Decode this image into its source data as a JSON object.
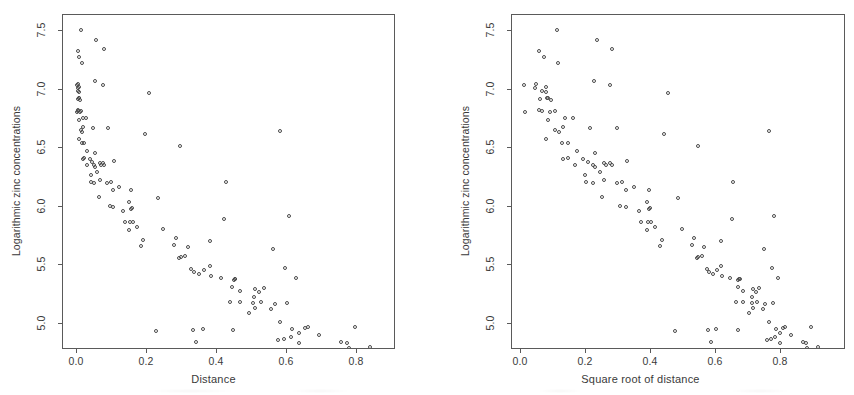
{
  "figure": {
    "panel_count": 2,
    "background": "#ffffff",
    "point_color": "#4a4a4a",
    "axis_color": "#5a5a5a"
  },
  "chart_data": [
    {
      "type": "scatter",
      "title": "",
      "xlabel": "Distance",
      "ylabel": "Logarithmic zinc concentrations",
      "xlim": [
        -0.035,
        0.915
      ],
      "ylim": [
        4.66,
        7.58
      ],
      "xticks": [
        0.0,
        0.2,
        0.4,
        0.6,
        0.8
      ],
      "xticklabels": [
        "0.0",
        "0.2",
        "0.4",
        "0.6",
        "0.8"
      ],
      "yticks": [
        5.0,
        5.5,
        6.0,
        6.5,
        7.0,
        7.5
      ],
      "yticklabels": [
        "5.0",
        "5.5",
        "6.0",
        "6.5",
        "7.0",
        "7.5"
      ],
      "grid": false,
      "legend": "none",
      "marker": "open-circle",
      "x": [
        0.001,
        0.012,
        0.103,
        0.19,
        0.277,
        0.364,
        0.19,
        0.091,
        0.047,
        0.001,
        0.002,
        0.005,
        0.01,
        0.017,
        0.074,
        0.075,
        0.077,
        0.079,
        0.082,
        0.08,
        0.079,
        0.085,
        0.097,
        0.104,
        0.108,
        0.112,
        0.119,
        0.129,
        0.135,
        0.141,
        0.147,
        0.152,
        0.156,
        0.163,
        0.169,
        0.175,
        0.181,
        0.187,
        0.194,
        0.2,
        0.206,
        0.212,
        0.218,
        0.224,
        0.231,
        0.237,
        0.243,
        0.249,
        0.256,
        0.262,
        0.268,
        0.274,
        0.28,
        0.287,
        0.293,
        0.299,
        0.305,
        0.312,
        0.318,
        0.324,
        0.33,
        0.336,
        0.343,
        0.349,
        0.355,
        0.361,
        0.368,
        0.374,
        0.38,
        0.386,
        0.392,
        0.399,
        0.405,
        0.411,
        0.417,
        0.424,
        0.43,
        0.436,
        0.442,
        0.448,
        0.455,
        0.461,
        0.467,
        0.473,
        0.48,
        0.486,
        0.492,
        0.498,
        0.504,
        0.511,
        0.517,
        0.523,
        0.529,
        0.536,
        0.542,
        0.548,
        0.554,
        0.56,
        0.567,
        0.573,
        0.579,
        0.585,
        0.592,
        0.598,
        0.604,
        0.61,
        0.616,
        0.623,
        0.629,
        0.635,
        0.641,
        0.648,
        0.654,
        0.66,
        0.666,
        0.672,
        0.679,
        0.685,
        0.691,
        0.697,
        0.704,
        0.71,
        0.716,
        0.722,
        0.728,
        0.735,
        0.741,
        0.747,
        0.753,
        0.76,
        0.766,
        0.772,
        0.778,
        0.784,
        0.791,
        0.797,
        0.803,
        0.809,
        0.816,
        0.822,
        0.828,
        0.834,
        0.84,
        0.847,
        0.853,
        0.859,
        0.865,
        0.872,
        0.878,
        0.884,
        0.89
      ],
      "y": [
        7.51,
        7.23,
        7.04,
        6.97,
        6.53,
        6.21,
        6.62,
        6.67,
        7.42
      ],
      "n_points": 155,
      "note": "Meuse river soil dataset: log zinc vs normalized distance to river"
    },
    {
      "type": "scatter",
      "title": "",
      "xlabel": "Square root of distance",
      "ylabel": "Logarithmic zinc concentrations",
      "xlim": [
        -0.03,
        0.96
      ],
      "ylim": [
        4.66,
        7.58
      ],
      "xticks": [
        0.0,
        0.2,
        0.4,
        0.6,
        0.8
      ],
      "xticklabels": [
        "0.0",
        "0.2",
        "0.4",
        "0.6",
        "0.8"
      ],
      "yticks": [
        5.0,
        5.5,
        6.0,
        6.5,
        7.0,
        7.5
      ],
      "yticklabels": [
        "5.0",
        "5.5",
        "6.0",
        "6.5",
        "7.0",
        "7.5"
      ],
      "grid": false,
      "legend": "none",
      "marker": "open-circle",
      "n_points": 155,
      "note": "Same response plotted against sqrt(distance), linearising the trend"
    }
  ],
  "panels": [
    {
      "id": "left",
      "xlabel": "Distance",
      "ylabel": "Logarithmic zinc concentrations",
      "xticklabels": [
        "0.0",
        "0.2",
        "0.4",
        "0.6",
        "0.8"
      ],
      "yticklabels": [
        "5.0",
        "5.5",
        "6.0",
        "6.5",
        "7.0",
        "7.5"
      ]
    },
    {
      "id": "right",
      "xlabel": "Square root of distance",
      "ylabel": "Logarithmic zinc concentrations",
      "xticklabels": [
        "0.0",
        "0.2",
        "0.4",
        "0.6",
        "0.8"
      ],
      "yticklabels": [
        "5.0",
        "5.5",
        "6.0",
        "6.5",
        "7.0",
        "7.5"
      ]
    }
  ],
  "series": {
    "distance": [
      0.00136,
      0.01222,
      0.10303,
      0.19009,
      0.27709,
      0.36407,
      0.19009,
      0.09125,
      0.04677,
      0.02409,
      0.03471,
      0.03492,
      0.01283,
      0.0,
      0.0,
      0.07106,
      0.09346,
      0.13009,
      0.15341,
      0.18712,
      0.21425,
      0.24657,
      0.04383,
      0.07299,
      0.11056,
      0.13961,
      0.17114,
      0.20331,
      0.23501,
      0.26628,
      0.29712,
      0.32754,
      0.35757,
      0.38722,
      0.41651,
      0.44544,
      0.47405,
      0.50233,
      0.53031,
      0.0,
      0.02403,
      0.04864,
      0.07364,
      0.09899,
      0.12467,
      0.15066,
      0.17694,
      0.20349,
      0.23029,
      0.25733,
      0.2846,
      0.31208,
      0.33976,
      0.36763,
      0.39568,
      0.4239,
      0.45228,
      0.48081,
      0.50948,
      0.53829,
      0.56722,
      0.59627,
      0.62543,
      0.6547,
      0.68407,
      0.71353,
      0.74308,
      0.77271,
      0.80242,
      0.8322,
      0.86205,
      0.89196,
      0.04383,
      0.07299,
      0.11056,
      0.13961,
      0.17114,
      0.20331,
      0.23501,
      0.26628,
      0.29712,
      0.32754,
      0.35757,
      0.38722,
      0.41651,
      0.44544,
      0.47405,
      0.50233,
      0.53031,
      0.0,
      0.02403,
      0.04864,
      0.07364,
      0.09899,
      0.12467,
      0.15066,
      0.17694,
      0.20349,
      0.23029,
      0.25733,
      0.2846,
      0.31208,
      0.33976,
      0.36763,
      0.39568,
      0.4239,
      0.45228,
      0.48081,
      0.50948,
      0.53829,
      0.56722,
      0.59627,
      0.62543,
      0.6547,
      0.68407,
      0.71353,
      0.74308,
      0.77271,
      0.80242,
      0.8322,
      0.86205,
      0.89196,
      0.07106,
      0.09346,
      0.13009,
      0.15341,
      0.18712,
      0.21425,
      0.24657,
      0.04383,
      0.07299,
      0.11056,
      0.13961,
      0.17114,
      0.20331,
      0.23501,
      0.26628,
      0.29712,
      0.32754,
      0.35757,
      0.38722,
      0.41651,
      0.44544,
      0.47405,
      0.50233,
      0.53031,
      0.56,
      0.58,
      0.605,
      0.62
    ],
    "log_zinc": [
      7.51,
      7.23,
      7.04,
      6.97,
      6.53,
      6.21,
      6.62,
      6.67,
      7.42,
      7.35,
      7.33,
      7.28,
      7.05,
      6.99,
      6.98,
      6.83,
      6.82,
      6.81,
      6.7,
      6.68,
      6.67,
      6.66,
      6.65,
      6.64,
      6.63,
      6.62,
      6.6,
      6.58,
      6.57,
      6.56,
      6.53,
      6.52,
      6.52,
      6.51,
      6.49,
      6.44,
      6.41,
      6.4,
      6.38,
      6.36,
      6.34,
      6.33,
      6.32,
      6.31,
      6.3,
      6.3,
      6.29,
      6.28,
      6.22,
      6.21,
      6.16,
      6.15,
      6.14,
      6.12,
      6.1,
      6.07,
      6.04,
      6.02,
      6.01,
      6.0,
      5.99,
      5.93,
      5.92,
      5.9,
      5.85,
      5.85,
      5.84,
      5.83,
      5.8,
      5.79,
      5.77,
      5.7,
      5.69,
      5.68,
      5.65,
      5.64,
      5.63,
      5.62,
      5.6,
      5.59,
      5.56,
      5.55,
      5.55,
      5.53,
      5.52,
      5.51,
      5.49,
      5.48,
      5.47,
      5.45,
      5.42,
      5.41,
      5.4,
      5.4,
      5.39,
      5.39,
      5.38,
      5.36,
      5.35,
      5.34,
      5.33,
      5.33,
      5.32,
      5.31,
      5.3,
      5.29,
      5.28,
      5.27,
      5.26,
      5.25,
      5.25,
      5.24,
      5.23,
      5.22,
      5.22,
      5.21,
      5.19,
      5.18,
      5.17,
      5.16,
      5.13,
      5.12,
      5.12,
      5.11,
      5.1,
      5.08,
      5.07,
      5.06,
      5.05,
      5.04,
      5.03,
      5.02,
      4.97,
      4.96,
      4.96,
      4.95,
      4.95,
      4.94,
      4.93,
      4.91,
      4.89,
      4.88,
      4.86,
      4.85,
      4.85,
      4.83,
      4.79,
      4.78,
      4.78,
      4.76,
      4.72,
      4.71
    ]
  }
}
